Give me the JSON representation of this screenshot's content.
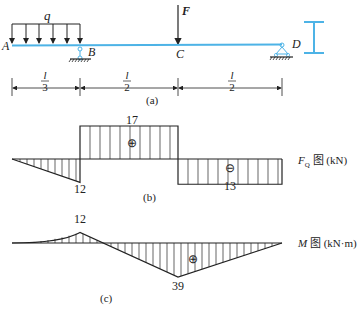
{
  "beam": {
    "load_label": "q",
    "force_label": "F",
    "points": {
      "A": "A",
      "B": "B",
      "C": "C",
      "D": "D"
    },
    "dimensions": [
      {
        "num": "l",
        "den": "3"
      },
      {
        "num": "l",
        "den": "2"
      },
      {
        "num": "l",
        "den": "2"
      }
    ],
    "caption": "(a)",
    "beam_color": "#4db3e6"
  },
  "shear": {
    "caption": "(b)",
    "title_symbol": "F",
    "title_sub": "Q",
    "title_rest": " 图 (kN)",
    "labels": {
      "max_pos": "17",
      "left_neg": "12",
      "right_neg": "13"
    },
    "signs": {
      "pos": "⊕",
      "neg": "⊖"
    }
  },
  "moment": {
    "caption": "(c)",
    "title_symbol": "M",
    "title_rest": " 图 (kN·m)",
    "labels": {
      "peak_B": "12",
      "peak_C": "39"
    },
    "signs": {
      "pos": "⊕"
    }
  },
  "chart_data": [
    {
      "type": "area",
      "title": "F_Q 图 (kN)",
      "x": [
        "A",
        "B-",
        "B+",
        "C-",
        "C+",
        "D"
      ],
      "values": [
        0,
        -12,
        17,
        17,
        -13,
        -13
      ],
      "note": "shear force diagram"
    },
    {
      "type": "area",
      "title": "M 图 (kN·m)",
      "x": [
        "A",
        "B",
        "zero",
        "C",
        "D"
      ],
      "values": [
        0,
        12,
        0,
        -39,
        0
      ],
      "labels": {
        "B": "12",
        "C": "39"
      },
      "note": "bending moment diagram"
    }
  ]
}
